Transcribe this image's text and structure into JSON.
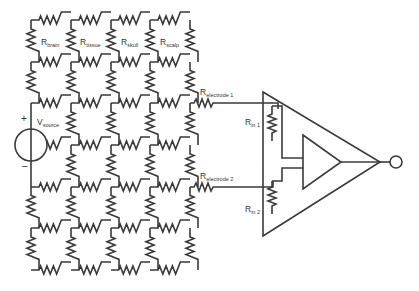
{
  "diagram": {
    "type": "circuit-schematic",
    "grid": {
      "columns_x": [
        31,
        71,
        111,
        150,
        190
      ],
      "rows_y": [
        20,
        62,
        103,
        145,
        187,
        228,
        270
      ]
    },
    "labels": {
      "r_brain": {
        "main": "R",
        "sub": "brain"
      },
      "r_tissue": {
        "main": "R",
        "sub": "tissue"
      },
      "r_skull": {
        "main": "R",
        "sub": "skull"
      },
      "r_scalp": {
        "main": "R",
        "sub": "scalp"
      },
      "v_source": {
        "main": "V",
        "sub": "source"
      },
      "r_electrode_1": {
        "main": "R",
        "sub": "electrode 1"
      },
      "r_electrode_2": {
        "main": "R",
        "sub": "electrode 2"
      },
      "r_in_1": {
        "main": "R",
        "sub": "in 1"
      },
      "r_in_2": {
        "main": "R",
        "sub": "in 2"
      },
      "plus": "+",
      "minus": "–"
    },
    "colors": {
      "line": "#3a3a3a",
      "background": "#ffffff"
    }
  }
}
